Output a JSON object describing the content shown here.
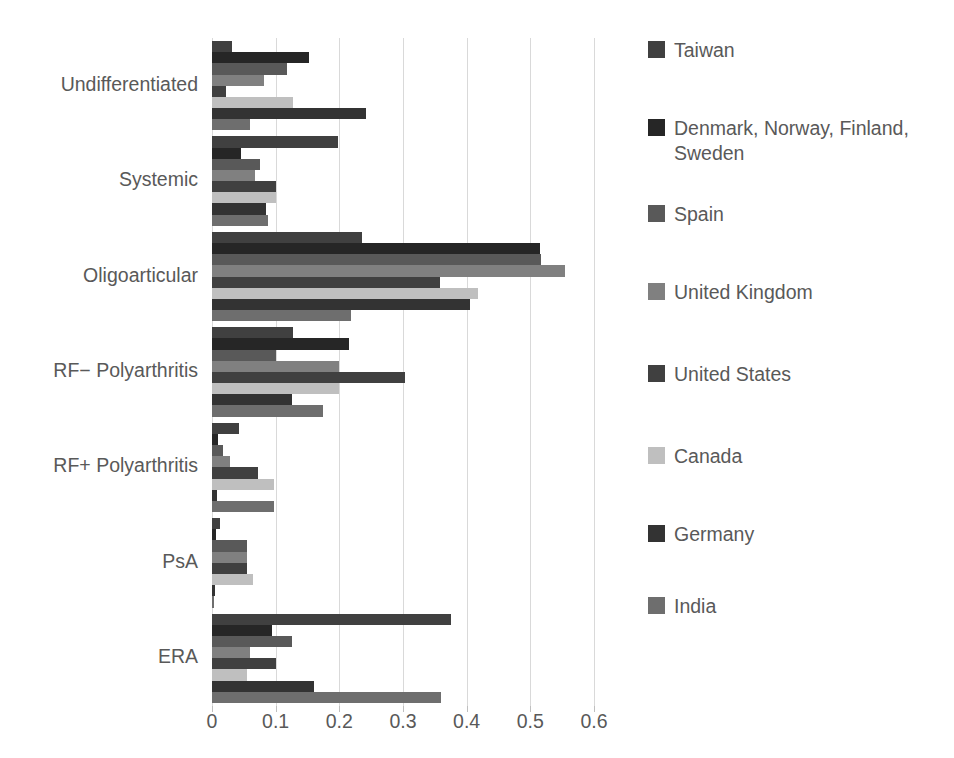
{
  "chart_data": {
    "type": "bar",
    "orientation": "horizontal",
    "title": "",
    "subtitle": "",
    "xlabel": "",
    "ylabel": "",
    "xlim": [
      0,
      0.6
    ],
    "xticks": [
      0,
      0.1,
      0.2,
      0.3,
      0.4,
      0.5,
      0.6
    ],
    "xtick_labels": [
      "0",
      "0.1",
      "0.2",
      "0.3",
      "0.4",
      "0.5",
      "0.6"
    ],
    "grid": "vertical",
    "legend_position": "right",
    "categories": [
      "Undifferentiated",
      "Systemic",
      "Oligoarticular",
      "RF− Polyarthritis",
      "RF+ Polyarthritis",
      "PsA",
      "ERA"
    ],
    "series": [
      {
        "name": "Taiwan",
        "color": "#404040",
        "values": [
          0.032,
          0.198,
          0.235,
          0.128,
          0.043,
          0.012,
          0.375
        ]
      },
      {
        "name": "Denmark, Norway, Finland, Sweden",
        "color": "#262626",
        "values": [
          0.152,
          0.045,
          0.515,
          0.215,
          0.01,
          0.007,
          0.095
        ]
      },
      {
        "name": "Spain",
        "color": "#595959",
        "values": [
          0.118,
          0.075,
          0.517,
          0.1,
          0.018,
          0.055,
          0.125
        ]
      },
      {
        "name": "United Kingdom",
        "color": "#808080",
        "values": [
          0.082,
          0.068,
          0.555,
          0.2,
          0.028,
          0.055,
          0.06
        ]
      },
      {
        "name": "United States",
        "color": "#404040",
        "values": [
          0.022,
          0.1,
          0.358,
          0.303,
          0.072,
          0.055,
          0.1
        ]
      },
      {
        "name": "Canada",
        "color": "#bfbfbf",
        "values": [
          0.128,
          0.1,
          0.418,
          0.2,
          0.098,
          0.065,
          0.055
        ]
      },
      {
        "name": "Germany",
        "color": "#333333",
        "values": [
          0.242,
          0.085,
          0.405,
          0.125,
          0.008,
          0.005,
          0.16
        ]
      },
      {
        "name": "India",
        "color": "#6e6e6e",
        "values": [
          0.06,
          0.088,
          0.218,
          0.175,
          0.097,
          0.003,
          0.36
        ]
      }
    ]
  },
  "legend": {
    "items": [
      {
        "label": "Taiwan"
      },
      {
        "label": "Denmark, Norway, Finland, Sweden"
      },
      {
        "label": "Spain"
      },
      {
        "label": "United Kingdom"
      },
      {
        "label": "United States"
      },
      {
        "label": "Canada"
      },
      {
        "label": "Germany"
      },
      {
        "label": "India"
      }
    ]
  },
  "axis": {
    "x_tick_labels": [
      "0",
      "0.1",
      "0.2",
      "0.3",
      "0.4",
      "0.5",
      "0.6"
    ],
    "y_tick_labels": [
      "Undifferentiated",
      "Systemic",
      "Oligoarticular",
      "RF− Polyarthritis",
      "RF+ Polyarthritis",
      "PsA",
      "ERA"
    ]
  },
  "colors": {
    "grid": "#d9d9d9",
    "text": "#595959",
    "background": "#ffffff"
  }
}
